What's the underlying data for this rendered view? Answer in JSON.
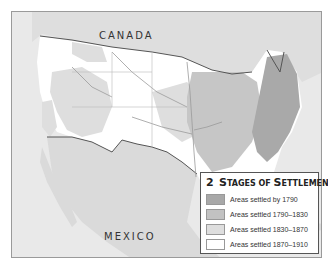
{
  "map": {
    "labels": {
      "canada": "CANADA",
      "mexico": "MEXICO"
    }
  },
  "legend": {
    "number": "2",
    "title_first": "S",
    "title_rest": "TAGES OF ",
    "title_s2": "S",
    "title_rest2": "ETTLEMENT",
    "items": [
      {
        "label": "Areas settled by 1790",
        "color": "#a8a8a8"
      },
      {
        "label": "Areas settled 1790–1830",
        "color": "#c2c2c2"
      },
      {
        "label": "Areas settled 1830–1870",
        "color": "#dedede"
      },
      {
        "label": "Areas settled 1870–1910",
        "color": "#ffffff"
      }
    ]
  },
  "colors": {
    "ocean": "#e6e6e6",
    "foreign_land": "#dcdcdc",
    "border": "#555555",
    "river": "#9a9a9a"
  }
}
